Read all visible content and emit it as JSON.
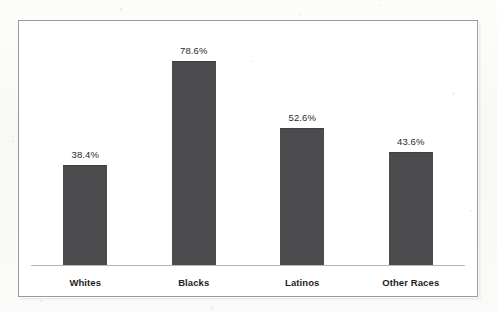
{
  "chart_data": {
    "type": "bar",
    "title": "",
    "subtitle": "",
    "xlabel": "",
    "ylabel": "",
    "categories": [
      "Whites",
      "Blacks",
      "Latinos",
      "Other Races"
    ],
    "values": [
      38.4,
      78.6,
      52.6,
      43.6
    ],
    "value_labels": [
      "38.4%",
      "78.6%",
      "52.6%",
      "43.6%"
    ],
    "series": [
      {
        "name": "",
        "values": [
          38.4,
          78.6,
          52.6,
          43.6
        ]
      }
    ],
    "ylim": [
      0,
      100
    ],
    "grid": false,
    "legend": false,
    "legend_position": "none",
    "axis_visible": {
      "x_axis_line": true,
      "y_axis_line": false,
      "y_tick_labels": false
    },
    "bar_color": "#4c4c4e",
    "value_label_color": "#2b2b2b",
    "category_label_color": "#1d1d1d",
    "plot_background": "#ffffff",
    "frame_border_color": "#9a9a9e",
    "axis_line_color": "#b6b6ba",
    "page_background": "#fbfbfa"
  }
}
